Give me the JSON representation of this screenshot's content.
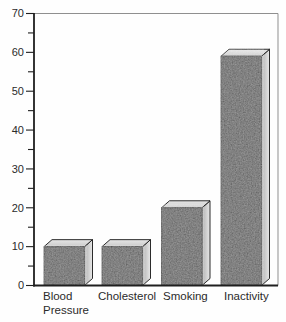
{
  "figure": {
    "background": "#fefefe",
    "description_name": "risk-factor-3d-bar-chart"
  },
  "chart_data": {
    "type": "bar",
    "variant": "3d-block-bars",
    "title": "",
    "xlabel": "",
    "ylabel": "",
    "categories": [
      "Blood Pressure",
      "Cholesterol",
      "Smoking",
      "Inactivity"
    ],
    "category_lines": [
      [
        "Blood",
        "Pressure"
      ],
      [
        "Cholesterol"
      ],
      [
        "Smoking"
      ],
      [
        "Inactivity"
      ]
    ],
    "values": [
      10,
      10,
      20,
      59
    ],
    "ylim": [
      0,
      70
    ],
    "y_major_tick_step": 10,
    "y_minor_tick_step": 5,
    "y_tick_labels": [
      "0",
      "10",
      "20",
      "30",
      "40",
      "50",
      "60",
      "70"
    ],
    "grid": false,
    "legend": false,
    "colors": {
      "bar_front": "#4c4c4c",
      "bar_top_near": "#c9c9c9",
      "bar_top_far": "#e6e6e6",
      "bar_side_near": "#b2b2b2",
      "bar_side_far": "#e8e8e8",
      "outline": "#141414",
      "axis": "#1f1f1f",
      "frame": "#8f8f8f",
      "text": "#2b2b2b",
      "background": "#fefefe"
    },
    "layout": {
      "plot": {
        "left": 34,
        "top": 13.5,
        "right": 278,
        "bottom": 285.5
      },
      "bar_width": 40.5,
      "bar_lefts": [
        44,
        102,
        161.5,
        221
      ],
      "depth": {
        "dx": 8,
        "dy": 7
      },
      "tick_major_len": 8,
      "tick_minor_len": 6,
      "tick_label_x_offset": 10,
      "label_x": [
        43,
        98,
        163,
        224
      ],
      "label_baseline_y": 300,
      "label_line_height": 14,
      "font_size_ticks": 11,
      "font_size_categories": 11.5
    }
  }
}
